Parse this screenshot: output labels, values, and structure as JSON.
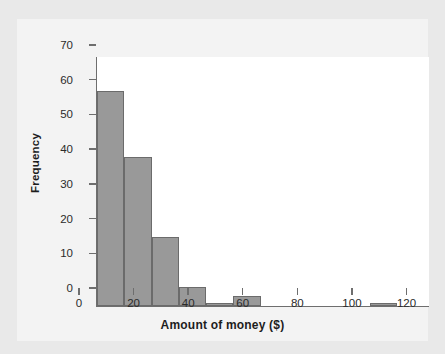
{
  "chart_data": {
    "type": "bar",
    "title": "",
    "subtitle": "",
    "xlabel": "Amount of money ($)",
    "ylabel": "Frequency",
    "xlim": [
      0,
      122
    ],
    "ylim": [
      0,
      72
    ],
    "grid": false,
    "legend": null,
    "bin_width": 10,
    "bin_edges": [
      0,
      10,
      20,
      30,
      40,
      50,
      60,
      70,
      80,
      90,
      100,
      110,
      120
    ],
    "categories": [
      "0-10",
      "10-20",
      "20-30",
      "30-40",
      "40-50",
      "50-60",
      "60-70",
      "70-80",
      "80-90",
      "90-100",
      "100-110",
      "110-120"
    ],
    "values": [
      62,
      43,
      20,
      5.5,
      1,
      3,
      0,
      0,
      0,
      0,
      1,
      0
    ],
    "xticks": [
      0,
      20,
      40,
      60,
      80,
      100,
      120
    ],
    "xticklabels": [
      "0",
      "20",
      "40",
      "60",
      "80",
      "100",
      "120"
    ],
    "yticks": [
      0,
      10,
      20,
      30,
      40,
      50,
      60,
      70
    ],
    "yticklabels": [
      "0",
      "10",
      "20",
      "30",
      "40",
      "50",
      "60",
      "70"
    ],
    "colors": {
      "bar_fill": "#999999",
      "bar_edge": "#6b6b6b",
      "axis": "#6e6e6e",
      "plot_background": "#ffffff",
      "card_background": "#f3f3f3",
      "figure_background": "#e9e9e9",
      "text": "#1d1d1d"
    }
  }
}
